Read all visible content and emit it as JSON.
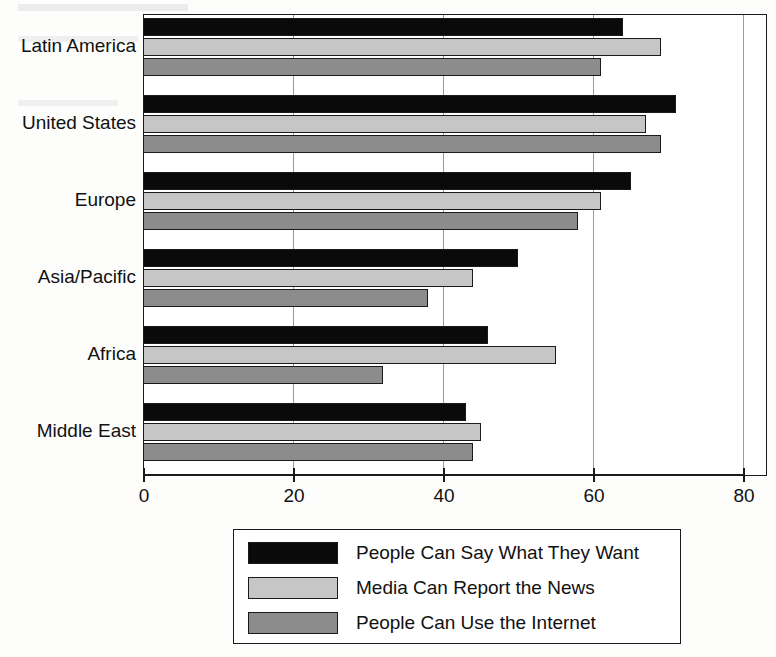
{
  "chart_data": {
    "type": "bar",
    "orientation": "horizontal",
    "title": "",
    "xlabel": "",
    "ylabel": "",
    "xlim": [
      0,
      80
    ],
    "xticks": [
      0,
      20,
      40,
      60,
      80
    ],
    "xtick_labels": [
      "0",
      "20",
      "40",
      "60",
      "80"
    ],
    "grid": true,
    "legend_position": "below-center",
    "categories": [
      "Latin America",
      "United States",
      "Europe",
      "Asia/Pacific",
      "Africa",
      "Middle East"
    ],
    "series": [
      {
        "name": "People Can Say What They Want",
        "color": "#0a0a0a",
        "values": [
          64,
          71,
          65,
          50,
          46,
          43
        ]
      },
      {
        "name": "Media Can Report the News",
        "color": "#c6c6c6",
        "values": [
          69,
          67,
          61,
          44,
          55,
          45
        ]
      },
      {
        "name": "People Can Use the Internet",
        "color": "#8c8c8c",
        "values": [
          61,
          69,
          58,
          38,
          32,
          44
        ]
      }
    ]
  },
  "legend": {
    "entries": [
      "People Can Say What They Want",
      "Media Can Report the News",
      "People Can Use the Internet"
    ]
  },
  "background_artifacts": [
    "scanned page bleed-through",
    "faint text lines"
  ]
}
